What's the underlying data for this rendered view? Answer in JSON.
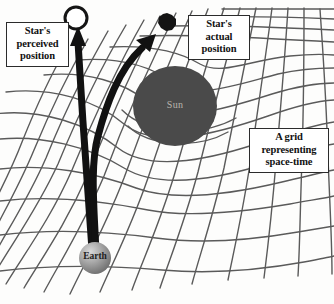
{
  "figure": {
    "background_color": "#fdfdfc"
  },
  "callouts": {
    "perceived": {
      "name": "star-perceived-position-label",
      "line1": "Star's",
      "line2": "perceived",
      "line3": "position"
    },
    "actual": {
      "name": "star-actual-position-label",
      "line1": "Star's",
      "line2": "actual",
      "line3": "position"
    },
    "grid": {
      "name": "space-time-grid-label",
      "line1": "A grid",
      "line2": "representing",
      "line3": "space-time"
    }
  },
  "bodies": {
    "sun": {
      "label": "Sun",
      "fill_color": "#4a4a4a",
      "text_color": "#b9b5ad",
      "center_x": 175,
      "center_y": 106,
      "radius_x": 42,
      "radius_y": 40
    },
    "earth": {
      "label": "Earth",
      "fill_color": "#9a9a9a",
      "text_color": "#1d1d1d",
      "center_x": 95,
      "center_y": 258,
      "radius": 16
    },
    "star_actual": {
      "marker": "filled-blob",
      "fill_color": "#141414",
      "center_x": 167,
      "center_y": 22,
      "radius": 9
    },
    "star_perceived": {
      "marker": "open-circle",
      "fill_color": "#ffffff",
      "stroke_color": "#151515",
      "center_x": 76,
      "center_y": 18,
      "radius": 11
    }
  },
  "grid": {
    "line_color": "#5a5a5a",
    "line_width": 1.4,
    "rows": 13,
    "cols": 15,
    "warped": true
  },
  "rays": {
    "straight": {
      "name": "perceived-light-ray",
      "color": "#111111",
      "width": 7,
      "from": "earth",
      "to": "star-perceived-position"
    },
    "curved": {
      "name": "actual-light-ray",
      "color": "#111111",
      "width": 7,
      "from": "earth",
      "to": "star-actual-position"
    }
  }
}
